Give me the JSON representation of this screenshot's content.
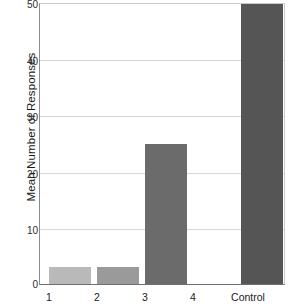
{
  "chart_data": {
    "type": "bar",
    "title": "",
    "xlabel": "",
    "ylabel": "Mean Number of Responses",
    "categories": [
      "1",
      "2",
      "3",
      "4",
      "Control"
    ],
    "values": [
      3,
      3,
      25,
      0,
      50
    ],
    "ylim": [
      0,
      50
    ],
    "yticks": [
      0,
      10,
      20,
      30,
      40,
      50
    ],
    "ytick_labels": [
      "0",
      "10",
      "20",
      "30",
      "40",
      "50"
    ],
    "grid": "horizontal",
    "legend": "none",
    "bar_colors": [
      "#b9b9b9",
      "#9a9a9a",
      "#6b6b6b",
      "#6b6b6b",
      "#555555"
    ],
    "colors": {
      "background": "#ffffff",
      "gridline": "#d6d6d6",
      "axis": "#6f6f6f",
      "text": "#1a1a1a"
    }
  }
}
